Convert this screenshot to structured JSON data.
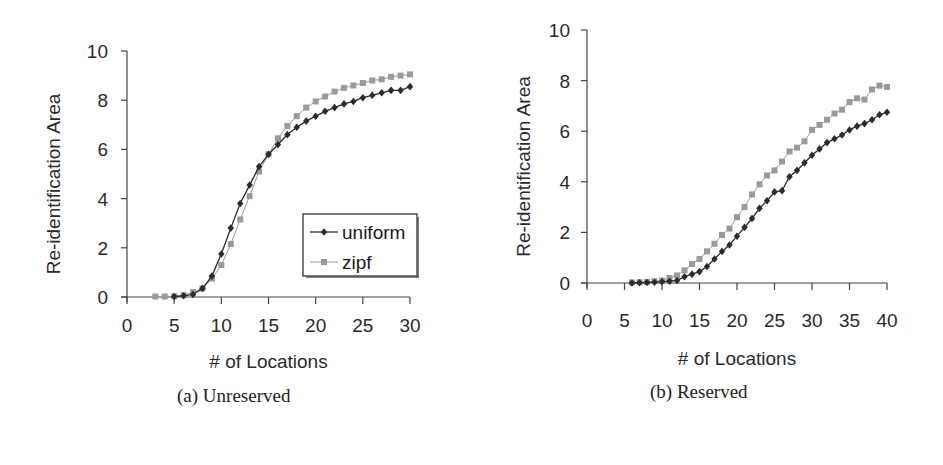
{
  "colors": {
    "uniform": "#2b2b2b",
    "zipf": "#9a9a9a",
    "axis": "#444444",
    "background": "#ffffff"
  },
  "captions": {
    "a": "(a) Unreserved",
    "b": "(b) Reserved"
  },
  "legend": {
    "uniform_label": "uniform",
    "zipf_label": "zipf"
  },
  "chart_data": [
    {
      "id": "a",
      "type": "line",
      "title": "(a) Unreserved",
      "xlabel": "# of Locations",
      "ylabel": "Re-identification Area",
      "xlim": [
        0,
        30
      ],
      "ylim": [
        0,
        10
      ],
      "xticks": [
        0,
        5,
        10,
        15,
        20,
        25,
        30
      ],
      "yticks": [
        0,
        2,
        4,
        6,
        8,
        10
      ],
      "grid": false,
      "legend_position": "lower right (inside plot)",
      "series": [
        {
          "name": "uniform",
          "marker": "diamond",
          "x": [
            5,
            6,
            7,
            8,
            9,
            10,
            11,
            12,
            13,
            14,
            15,
            16,
            17,
            18,
            19,
            20,
            21,
            22,
            23,
            24,
            25,
            26,
            27,
            28,
            29,
            30
          ],
          "values": [
            0.02,
            0.05,
            0.1,
            0.35,
            0.85,
            1.75,
            2.8,
            3.8,
            4.55,
            5.3,
            5.8,
            6.2,
            6.6,
            6.9,
            7.15,
            7.35,
            7.55,
            7.7,
            7.85,
            7.95,
            8.1,
            8.2,
            8.3,
            8.4,
            8.4,
            8.55
          ]
        },
        {
          "name": "zipf",
          "marker": "square",
          "x": [
            3,
            4,
            5,
            6,
            7,
            8,
            9,
            10,
            11,
            12,
            13,
            14,
            15,
            16,
            17,
            18,
            19,
            20,
            21,
            22,
            23,
            24,
            25,
            26,
            27,
            28,
            29,
            30
          ],
          "values": [
            0.02,
            0.02,
            0.03,
            0.07,
            0.2,
            0.35,
            0.75,
            1.3,
            2.15,
            3.15,
            4.1,
            5.1,
            5.8,
            6.45,
            6.95,
            7.35,
            7.7,
            7.95,
            8.15,
            8.35,
            8.5,
            8.6,
            8.7,
            8.8,
            8.85,
            8.95,
            9.0,
            9.05
          ]
        }
      ]
    },
    {
      "id": "b",
      "type": "line",
      "title": "(b) Reserved",
      "xlabel": "# of Locations",
      "ylabel": "Re-identification Area",
      "xlim": [
        0,
        40
      ],
      "ylim": [
        0,
        10
      ],
      "xticks": [
        0,
        5,
        10,
        15,
        20,
        25,
        30,
        35,
        40
      ],
      "yticks": [
        0,
        2,
        4,
        6,
        8,
        10
      ],
      "grid": false,
      "legend_position": "none",
      "series": [
        {
          "name": "uniform",
          "marker": "diamond",
          "x": [
            6,
            7,
            8,
            9,
            10,
            11,
            12,
            13,
            14,
            15,
            16,
            17,
            18,
            19,
            20,
            21,
            22,
            23,
            24,
            25,
            26,
            27,
            28,
            29,
            30,
            31,
            32,
            33,
            34,
            35,
            36,
            37,
            38,
            39,
            40
          ],
          "values": [
            0.0,
            0.01,
            0.02,
            0.03,
            0.05,
            0.07,
            0.1,
            0.25,
            0.35,
            0.45,
            0.65,
            0.95,
            1.25,
            1.5,
            1.85,
            2.2,
            2.55,
            2.95,
            3.25,
            3.6,
            3.65,
            4.2,
            4.45,
            4.75,
            5.05,
            5.3,
            5.55,
            5.7,
            5.85,
            6.05,
            6.2,
            6.3,
            6.45,
            6.65,
            6.75
          ]
        },
        {
          "name": "zipf",
          "marker": "square",
          "x": [
            6,
            7,
            8,
            9,
            10,
            11,
            12,
            13,
            14,
            15,
            16,
            17,
            18,
            19,
            20,
            21,
            22,
            23,
            24,
            25,
            26,
            27,
            28,
            29,
            30,
            31,
            32,
            33,
            34,
            35,
            36,
            37,
            38,
            39,
            40
          ],
          "values": [
            0.02,
            0.03,
            0.04,
            0.07,
            0.1,
            0.2,
            0.3,
            0.5,
            0.75,
            0.95,
            1.25,
            1.55,
            1.9,
            2.15,
            2.6,
            3.0,
            3.5,
            3.9,
            4.25,
            4.45,
            4.8,
            5.2,
            5.35,
            5.6,
            6.05,
            6.25,
            6.45,
            6.7,
            6.85,
            7.15,
            7.3,
            7.25,
            7.65,
            7.8,
            7.75
          ]
        }
      ]
    }
  ]
}
